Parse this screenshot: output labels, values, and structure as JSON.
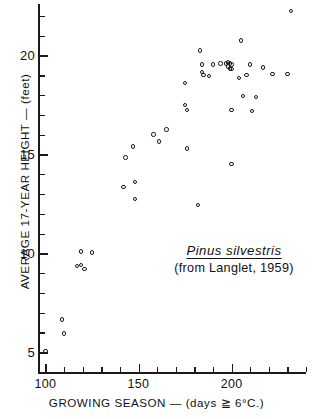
{
  "chart_data": {
    "type": "scatter",
    "title": "",
    "xlabel": "GROWING SEASON — (days ≧ 6°C.)",
    "ylabel": "AVERAGE 17-YEAR HEIGHT — (feet)",
    "xlim": [
      96,
      240
    ],
    "ylim": [
      4.0,
      22.6
    ],
    "grid": false,
    "legend": null,
    "xticks_major": [
      100,
      150,
      200
    ],
    "xticklabels": [
      "100",
      "150",
      "200"
    ],
    "xticks_minor": [
      110,
      120,
      130,
      140,
      160,
      170,
      180,
      190,
      210,
      220,
      230,
      240
    ],
    "yticks_major": [
      5,
      10,
      15,
      20
    ],
    "yticklabels": [
      "5",
      "10",
      "15",
      "20"
    ],
    "yticks_minor": [
      6,
      7,
      8,
      9,
      11,
      12,
      13,
      14,
      16,
      17,
      18,
      19,
      21,
      22
    ],
    "marker": "open-circle",
    "series": [
      {
        "name": "Pinus silvestris provenances",
        "points": [
          [
            100,
            5.05
          ],
          [
            109,
            6.65
          ],
          [
            110,
            5.95
          ],
          [
            117,
            9.35
          ],
          [
            119,
            9.4
          ],
          [
            119,
            10.1
          ],
          [
            121,
            9.2
          ],
          [
            125,
            10.05
          ],
          [
            142,
            13.35
          ],
          [
            143,
            14.85
          ],
          [
            147,
            15.4
          ],
          [
            148,
            13.6
          ],
          [
            148,
            12.75
          ],
          [
            158,
            16.0
          ],
          [
            161,
            15.65
          ],
          [
            165,
            16.25
          ],
          [
            175,
            17.5
          ],
          [
            175,
            18.6
          ],
          [
            176,
            17.25
          ],
          [
            176,
            15.3
          ],
          [
            182,
            12.45
          ],
          [
            183,
            20.25
          ],
          [
            184,
            19.55
          ],
          [
            184,
            19.15
          ],
          [
            185,
            19.0
          ],
          [
            188,
            18.95
          ],
          [
            190,
            19.55
          ],
          [
            194,
            19.6
          ],
          [
            197,
            19.6
          ],
          [
            198,
            19.65
          ],
          [
            198,
            19.45
          ],
          [
            199,
            19.6
          ],
          [
            199,
            19.35
          ],
          [
            200,
            19.55
          ],
          [
            200,
            19.3
          ],
          [
            200,
            17.25
          ],
          [
            200,
            14.5
          ],
          [
            204,
            18.85
          ],
          [
            205,
            20.75
          ],
          [
            206,
            17.95
          ],
          [
            208,
            19.0
          ],
          [
            210,
            19.55
          ],
          [
            211,
            17.2
          ],
          [
            213,
            17.9
          ],
          [
            217,
            19.4
          ],
          [
            222,
            19.05
          ],
          [
            230,
            19.05
          ],
          [
            232,
            22.25
          ]
        ]
      }
    ],
    "annotations": [
      {
        "id": "species",
        "text": "Pinus silvestris",
        "style": "italic-underline"
      },
      {
        "id": "source",
        "text": "(from Langlet, 1959)",
        "style": "plain"
      }
    ]
  },
  "axes": {
    "x_label": "GROWING SEASON — (days ≧ 6°C.)",
    "y_label": "AVERAGE 17-YEAR HEIGHT — (feet)"
  },
  "annotation": {
    "species": "Pinus silvestris",
    "source": "(from Langlet, 1959)"
  },
  "colors": {
    "ink": "#1a1a1a",
    "background": "#ffffff"
  }
}
